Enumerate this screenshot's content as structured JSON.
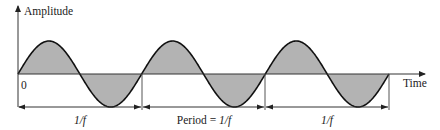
{
  "diagram": {
    "type": "sine-wave-period",
    "y_axis_label": "Amplitude",
    "x_axis_label": "Time",
    "origin_label": "0",
    "cycles": 3,
    "period_labels": [
      {
        "prefix": "",
        "value": "1/f"
      },
      {
        "prefix": "Period = ",
        "value": "1/f"
      },
      {
        "prefix": "",
        "value": "1/f"
      }
    ],
    "colors": {
      "fill": "#b3b3b3",
      "stroke": "#111111",
      "axis": "#333333",
      "guide": "#555555"
    }
  }
}
